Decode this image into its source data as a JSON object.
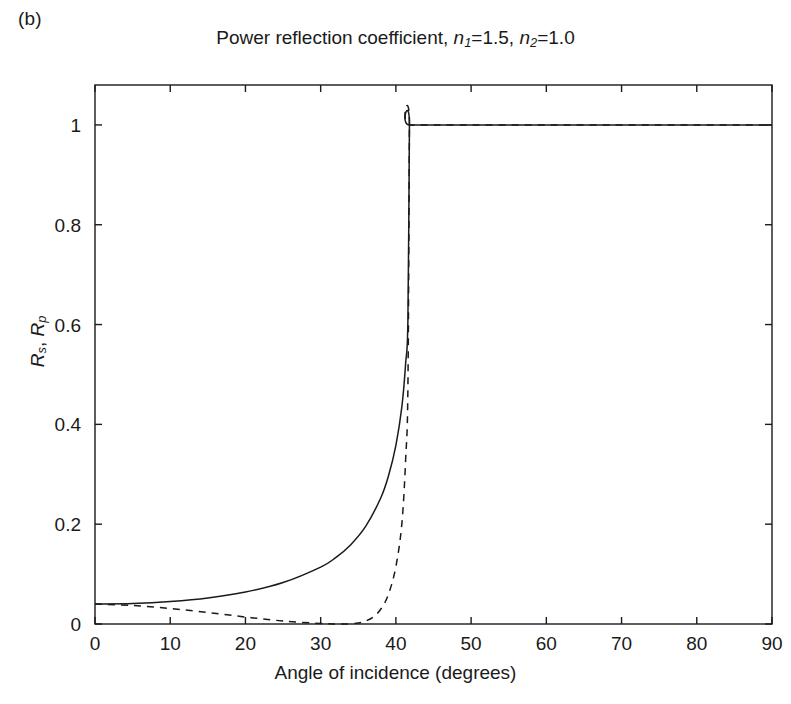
{
  "panel": {
    "label": "(b)"
  },
  "chart_data": {
    "type": "line",
    "title": "Power reflection coefficient, n1=1.5, n2=1.0",
    "title_parts": {
      "prefix": "Power reflection coefficient, ",
      "n_symbol": "n",
      "sub1": "1",
      "eq1": "=1.5, ",
      "sub2": "2",
      "eq2": "=1.0"
    },
    "xlabel": "Angle of incidence (degrees)",
    "ylabel": "Rs, Rp",
    "ylabel_parts": {
      "r_symbol": "R",
      "sub_s": "s",
      "separator": ", ",
      "sub_p": "p"
    },
    "xlim": [
      0,
      90
    ],
    "ylim": [
      0,
      1.08
    ],
    "xticks": [
      0,
      10,
      20,
      30,
      40,
      50,
      60,
      70,
      80,
      90
    ],
    "xtick_labels": [
      "0",
      "10",
      "20",
      "30",
      "40",
      "50",
      "60",
      "70",
      "80",
      "90"
    ],
    "yticks": [
      0,
      0.2,
      0.4,
      0.6,
      0.8,
      1
    ],
    "ytick_labels": [
      "0",
      "0.2",
      "0.4",
      "0.6",
      "0.8",
      "1"
    ],
    "grid": false,
    "legend": "none",
    "n1": 1.5,
    "n2": 1.0,
    "critical_angle_deg": 41.8,
    "brewster_angle_deg": 33.69,
    "normal_incidence_reflectance": 0.04,
    "line_color": "#1a1a1a",
    "series": [
      {
        "name": "Rs",
        "style": "solid",
        "x": [
          0,
          5,
          10,
          15,
          20,
          25,
          30,
          32,
          34,
          36,
          38,
          39,
          40,
          40.8,
          41.3,
          41.6,
          41.8,
          41.81,
          50,
          60,
          70,
          80,
          90
        ],
        "values": [
          0.04,
          0.041,
          0.045,
          0.052,
          0.064,
          0.083,
          0.114,
          0.133,
          0.159,
          0.196,
          0.253,
          0.296,
          0.358,
          0.436,
          0.523,
          0.61,
          1.0,
          1.0,
          1.0,
          1.0,
          1.0,
          1.0,
          1.0
        ]
      },
      {
        "name": "Rp",
        "style": "dashed",
        "x": [
          0,
          5,
          10,
          15,
          20,
          25,
          30,
          32,
          33.7,
          35,
          36,
          37,
          38,
          39,
          40,
          40.8,
          41.3,
          41.6,
          41.8,
          41.81,
          50,
          60,
          70,
          80,
          90
        ],
        "values": [
          0.04,
          0.037,
          0.031,
          0.023,
          0.014,
          0.006,
          0.001,
          0.0,
          0.0,
          0.002,
          0.006,
          0.014,
          0.03,
          0.059,
          0.115,
          0.202,
          0.331,
          0.476,
          1.0,
          1.0,
          1.0,
          1.0,
          1.0,
          1.0,
          1.0
        ]
      }
    ]
  },
  "geometry": {
    "plot_left": 95,
    "plot_right": 772,
    "plot_top": 85,
    "plot_bottom": 624,
    "tick_len": 7
  }
}
